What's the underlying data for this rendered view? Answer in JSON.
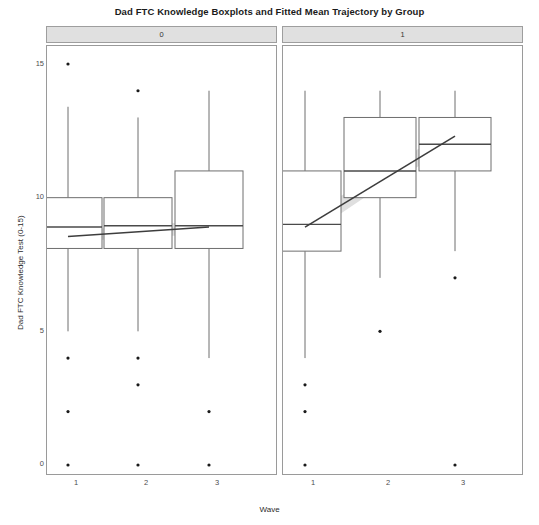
{
  "chart_data": {
    "type": "box",
    "title": "Dad FTC Knowledge Boxplots and Fitted Mean Trajectory by Group",
    "xlabel": "Wave",
    "ylabel": "Dad FTC Knowledge Test (0-15)",
    "ylim": [
      0,
      15
    ],
    "yticks": [
      0,
      5,
      10,
      15
    ],
    "yticklabels": [
      "0",
      "5",
      "10",
      "15"
    ],
    "xticks": [
      1,
      2,
      3
    ],
    "xticklabels": [
      "1",
      "2",
      "3"
    ],
    "grid": false,
    "legend": "none",
    "facet_variable": "Group",
    "facets": [
      {
        "label": "0",
        "boxes": [
          {
            "x": 1,
            "whisker_low": 5,
            "q1": 8.1,
            "median": 8.9,
            "q3": 10.0,
            "whisker_high": 13.4,
            "outliers": [
              15,
              4,
              2,
              0
            ]
          },
          {
            "x": 2,
            "whisker_low": 5,
            "q1": 8.1,
            "median": 8.95,
            "q3": 10.0,
            "whisker_high": 13.0,
            "outliers": [
              14,
              4,
              3,
              0
            ]
          },
          {
            "x": 3,
            "whisker_low": 4,
            "q1": 8.1,
            "median": 8.95,
            "q3": 11.0,
            "whisker_high": 14.0,
            "outliers": [
              2,
              0
            ]
          }
        ],
        "fit_line": {
          "x": [
            1,
            3
          ],
          "y": [
            8.55,
            8.9
          ]
        },
        "fit_ribbon": {
          "x": [
            1,
            2,
            3
          ],
          "lower": [
            8.3,
            8.55,
            8.6
          ],
          "upper": [
            8.8,
            8.9,
            9.2
          ]
        }
      },
      {
        "label": "1",
        "boxes": [
          {
            "x": 1,
            "whisker_low": 4,
            "q1": 8.0,
            "median": 9.0,
            "q3": 11.0,
            "whisker_high": 14.0,
            "outliers": [
              3,
              2,
              0
            ]
          },
          {
            "x": 2,
            "whisker_low": 7,
            "q1": 10.0,
            "median": 11.0,
            "q3": 13.0,
            "whisker_high": 14.0,
            "outliers": [
              5
            ]
          },
          {
            "x": 3,
            "whisker_low": 8,
            "q1": 11.0,
            "median": 12.0,
            "q3": 13.0,
            "whisker_high": 14.0,
            "outliers": [
              7,
              0
            ]
          }
        ],
        "fit_line": {
          "x": [
            1,
            3
          ],
          "y": [
            8.9,
            12.3
          ]
        },
        "fit_ribbon": {
          "x": [
            1,
            2,
            3
          ],
          "lower": [
            8.5,
            10.4,
            11.9
          ],
          "upper": [
            9.3,
            10.9,
            12.7
          ]
        }
      }
    ],
    "colors": {
      "box_stroke": "#6e6e6e",
      "line": "#3d3d3d",
      "ribbon": "#d4d4d4",
      "outlier": "#1a1a1a",
      "panel_border": "#9a9a9a",
      "strip_fill": "#e0e0e0"
    }
  }
}
